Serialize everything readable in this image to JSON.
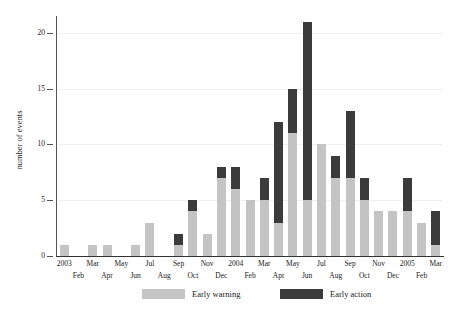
{
  "chart_data": {
    "type": "bar",
    "title": "",
    "subtitle": "",
    "xlabel": "",
    "ylabel": "number of events",
    "stacked": true,
    "grid": true,
    "legend_position": "bottom",
    "ylim": [
      0,
      21.5
    ],
    "yticks": [
      0,
      5,
      10,
      15,
      20
    ],
    "ytick_labels": [
      "0",
      "5",
      "10",
      "15",
      "20"
    ],
    "categories": [
      "2003",
      "Feb",
      "Mar",
      "Apr",
      "May",
      "Jun",
      "Jul",
      "Aug",
      "Sep",
      "Oct",
      "Nov",
      "Dec",
      "2004",
      "Feb",
      "Mar",
      "Apr",
      "May",
      "Jun",
      "Jul",
      "Aug",
      "Sep",
      "Oct",
      "Nov",
      "Dec",
      "2005",
      "Feb",
      "Mar"
    ],
    "series": [
      {
        "name": "Early warning",
        "color": "#c4c4c4",
        "values": [
          1,
          0,
          1,
          1,
          0,
          1,
          3,
          0,
          1,
          4,
          2,
          7,
          6,
          5,
          5,
          3,
          11,
          5,
          10,
          7,
          7,
          5,
          4,
          4,
          4,
          3,
          1
        ]
      },
      {
        "name": "Early action",
        "color": "#3b3b3b",
        "values": [
          0,
          0,
          0,
          0,
          0,
          0,
          0,
          0,
          1,
          1,
          0,
          1,
          2,
          0,
          2,
          9,
          4,
          16,
          0,
          2,
          6,
          2,
          0,
          0,
          3,
          0,
          3
        ]
      }
    ],
    "totals": [
      1,
      0,
      1,
      1,
      0,
      1,
      3,
      0,
      2,
      5,
      2,
      8,
      8,
      5,
      7,
      12,
      15,
      21,
      10,
      9,
      13,
      7,
      4,
      4,
      7,
      3,
      4
    ]
  },
  "axis": {
    "ylabel": "number of events"
  },
  "legend": {
    "items": [
      {
        "label": "Early warning",
        "color": "#c4c4c4"
      },
      {
        "label": "Early action",
        "color": "#3b3b3b"
      }
    ]
  }
}
